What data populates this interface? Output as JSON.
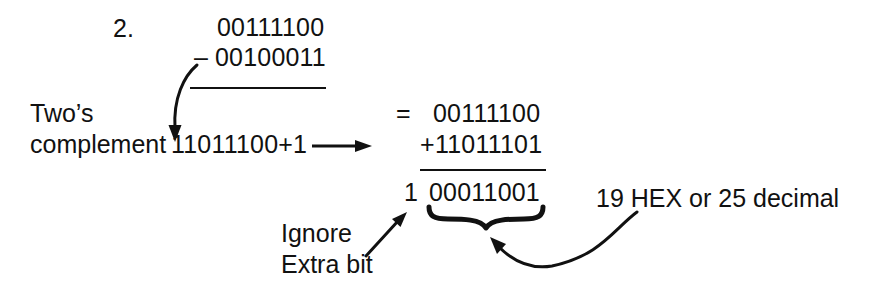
{
  "problem": {
    "number_label": "2.",
    "minuend": "00111100",
    "minus_sign": "–",
    "subtrahend": "00100011",
    "twos_label_line1": "Two’s",
    "twos_label_line2": "complement",
    "twos_value": "11011100+1",
    "equals_sign": "=",
    "addend_top": "00111100",
    "plus_sign": "+",
    "addend_bottom": "11011101",
    "carry_bit": "1",
    "result": "00011001",
    "ignore_line1": "Ignore",
    "ignore_line2": "Extra bit",
    "annotation": "19 HEX or 25 decimal"
  },
  "colors": {
    "ink": "#111111",
    "background": "#ffffff"
  },
  "icons": {
    "curved_arrow_down": "curved-arrow-down-icon",
    "straight_arrow_right": "straight-arrow-right-icon",
    "diagonal_arrow_up_right": "diagonal-arrow-up-right-icon",
    "curly_brace": "curly-brace-icon",
    "curved_arrow_left": "curved-arrow-left-icon"
  }
}
